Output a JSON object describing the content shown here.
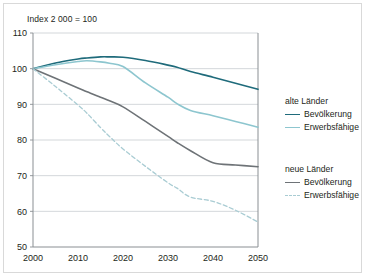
{
  "chart": {
    "title": "Index 2 000 = 100",
    "axis_note": "Index 2 000 = 100"
  },
  "legend": {
    "groups": [
      {
        "heading": "alte Länder",
        "entries": [
          {
            "label": "Bevölkerung",
            "color": "#1f6b7b",
            "style": "solid"
          },
          {
            "label": "Erwerbsfähige",
            "color": "#8dc6cf",
            "style": "solid"
          }
        ]
      },
      {
        "heading": "neue Länder",
        "entries": [
          {
            "label": "Bevölkerung",
            "color": "#6e7377",
            "style": "solid"
          },
          {
            "label": "Erwerbsfähige",
            "color": "#a9ccd3",
            "style": "dashed"
          }
        ]
      }
    ]
  },
  "axes": {
    "y_ticks": [
      "110",
      "100",
      "90",
      "80",
      "70",
      "60",
      "50"
    ],
    "x_ticks": [
      "2000",
      "2010",
      "2020",
      "2030",
      "2040",
      "2050"
    ]
  },
  "chart_data": {
    "type": "line",
    "title": "Index 2 000 = 100",
    "xlabel": "",
    "ylabel": "Index 2 000 = 100",
    "xlim": [
      2000,
      2050
    ],
    "ylim": [
      50,
      110
    ],
    "ytick_step": 10,
    "xtick_step": 10,
    "grid": "horizontal",
    "legend_position": "right",
    "x": [
      2000,
      2005,
      2010,
      2012,
      2015,
      2017,
      2020,
      2025,
      2030,
      2032,
      2035,
      2040,
      2045,
      2050
    ],
    "series": [
      {
        "name": "alte Länder – Bevölkerung",
        "group": "alte Länder",
        "color": "#1f6b7b",
        "style": "solid",
        "values": [
          100.0,
          101.6,
          102.7,
          103.0,
          103.3,
          103.3,
          103.2,
          102.3,
          101.0,
          100.4,
          99.2,
          97.6,
          95.9,
          94.2
        ]
      },
      {
        "name": "alte Länder – Erwerbsfähige",
        "group": "alte Länder",
        "color": "#8dc6cf",
        "style": "solid",
        "values": [
          100.0,
          101.1,
          102.0,
          102.2,
          101.9,
          101.5,
          100.6,
          96.0,
          92.0,
          90.2,
          88.3,
          86.8,
          85.2,
          83.6
        ]
      },
      {
        "name": "neue Länder – Bevölkerung",
        "group": "neue Länder",
        "color": "#6e7377",
        "style": "solid",
        "values": [
          100.0,
          97.3,
          94.6,
          93.5,
          92.0,
          91.0,
          89.3,
          85.2,
          81.0,
          79.3,
          77.0,
          73.6,
          73.0,
          72.5
        ]
      },
      {
        "name": "neue Länder – Erwerbsfähige",
        "group": "neue Länder",
        "color": "#a9ccd3",
        "style": "dashed",
        "values": [
          100.0,
          95.0,
          89.8,
          87.5,
          83.5,
          81.0,
          77.5,
          72.6,
          68.0,
          66.5,
          64.0,
          62.8,
          60.3,
          57.0
        ]
      }
    ]
  }
}
